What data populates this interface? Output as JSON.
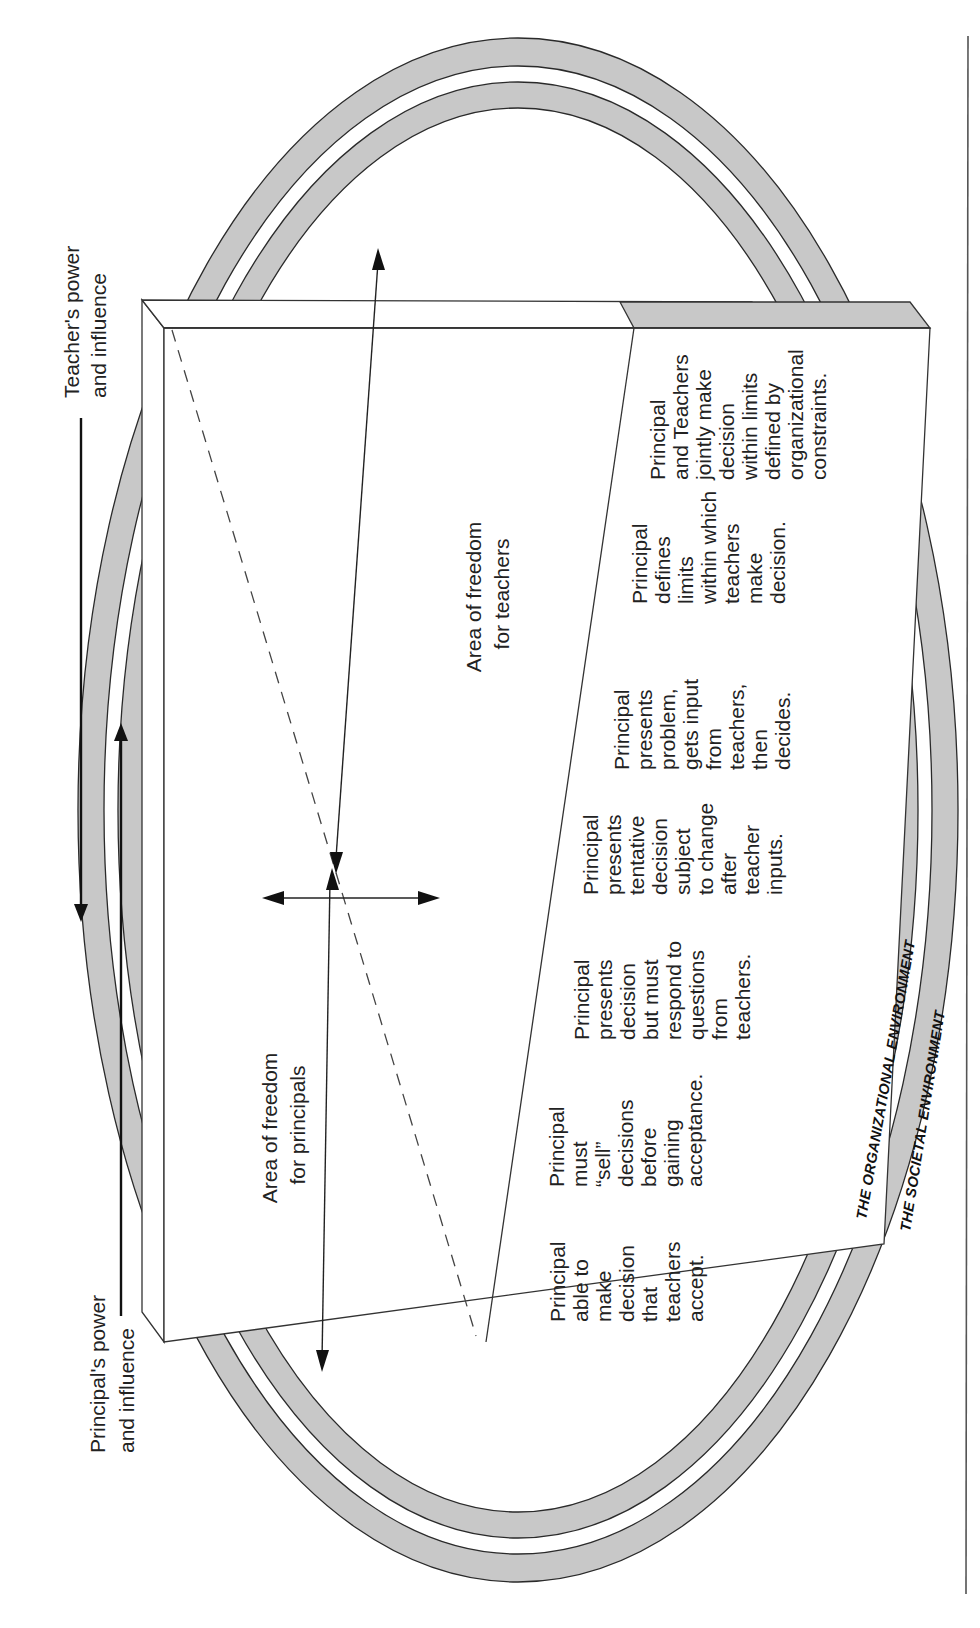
{
  "diagram": {
    "orientation": "rotated-90-ccw",
    "axis_labels": {
      "teacher_power": [
        "Teacher's power",
        "and influence"
      ],
      "principal_power": [
        "Principal's power",
        "and influence"
      ]
    },
    "areas": {
      "teachers": [
        "Area of freedom",
        "for teachers"
      ],
      "principals": [
        "Area of freedom",
        "for principals"
      ]
    },
    "continuum": [
      {
        "id": "1",
        "lines": [
          "Principal",
          "able to",
          "make",
          "decision",
          "that",
          "teachers",
          "accept."
        ]
      },
      {
        "id": "2",
        "lines": [
          "Principal",
          "must",
          "“sell”",
          "decisions",
          "before",
          "gaining",
          "acceptance."
        ]
      },
      {
        "id": "3",
        "lines": [
          "Principal",
          "presents",
          "decision",
          "but must",
          "respond to",
          "questions",
          "from",
          "teachers."
        ]
      },
      {
        "id": "4",
        "lines": [
          "Principal",
          "presents",
          "tentative",
          "decision",
          "subject",
          "to change",
          "after",
          "teacher",
          "inputs."
        ]
      },
      {
        "id": "5",
        "lines": [
          "Principal",
          "presents",
          "problem,",
          "gets input",
          "from",
          "teachers,",
          "then",
          "decides."
        ]
      },
      {
        "id": "6",
        "lines": [
          "Principal",
          "defines",
          "limits",
          "within which",
          "teachers",
          "make",
          "decision."
        ]
      },
      {
        "id": "7",
        "lines": [
          "Principal",
          "and Teachers",
          "jointly make",
          "decision",
          "within limits",
          "defined by",
          "organizational",
          "constraints."
        ]
      }
    ],
    "environments": {
      "organizational": "THE ORGANIZATIONAL ENVIRONMENT",
      "societal": "THE SOCIETAL ENVIRONMENT"
    },
    "colors": {
      "ring_fill": "#c8c8c8",
      "line": "#2a2a2a",
      "background": "#ffffff"
    }
  }
}
